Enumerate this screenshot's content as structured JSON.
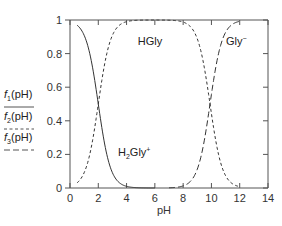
{
  "chart_data": {
    "type": "line",
    "title": "",
    "xlabel": "pH",
    "ylabel": "",
    "xlim": [
      0,
      14
    ],
    "ylim": [
      0,
      1
    ],
    "xticks": [
      0,
      2,
      4,
      6,
      8,
      10,
      12,
      14
    ],
    "xtick_labels": [
      "0",
      "2",
      "4",
      "6",
      "8",
      "10",
      "12",
      "14"
    ],
    "yticks": [
      0,
      0.2,
      0.4,
      0.6,
      0.8,
      1
    ],
    "ytick_labels": [
      "0",
      "0.2",
      "0.4",
      "0.6",
      "0.8",
      "1"
    ],
    "grid": false,
    "legend_position": "left-outside",
    "pKa": [
      2.0,
      9.9
    ],
    "x_range_plotted": [
      0.5,
      12.0
    ],
    "series": [
      {
        "name": "f1(pH)",
        "species": "H2Gly+",
        "style": "solid",
        "x": [
          0.5,
          1,
          1.5,
          2,
          2.5,
          3,
          3.5,
          4,
          4.5,
          5,
          5.5,
          6
        ],
        "values": [
          0.99,
          0.91,
          0.76,
          0.5,
          0.24,
          0.09,
          0.03,
          0.01,
          0.003,
          0.001,
          0.0,
          0.0
        ]
      },
      {
        "name": "f2(pH)",
        "species": "HGly",
        "style": "short-dash",
        "x": [
          0.5,
          1,
          1.5,
          2,
          2.5,
          3,
          4,
          5,
          6,
          7,
          8,
          9,
          9.5,
          10,
          10.5,
          11,
          11.5,
          12
        ],
        "values": [
          0.03,
          0.09,
          0.24,
          0.5,
          0.76,
          0.91,
          0.99,
          1.0,
          1.0,
          1.0,
          0.99,
          0.89,
          0.72,
          0.44,
          0.2,
          0.07,
          0.02,
          0.01
        ]
      },
      {
        "name": "f3(pH)",
        "species": "Gly-",
        "style": "long-dash",
        "x": [
          7,
          8,
          8.5,
          9,
          9.5,
          10,
          10.5,
          11,
          11.5,
          12
        ],
        "values": [
          0.0,
          0.01,
          0.04,
          0.11,
          0.28,
          0.56,
          0.8,
          0.93,
          0.98,
          0.99
        ]
      }
    ],
    "annotations": [
      {
        "text": "HGly",
        "x": 4.6,
        "y": 0.88
      },
      {
        "text": "Gly⁻",
        "x": 10.6,
        "y": 0.88
      },
      {
        "text": "H₂Gly⁺",
        "x": 4.5,
        "y": 0.26
      }
    ]
  },
  "legend": {
    "items": [
      {
        "label_f": "f",
        "label_sub": "1",
        "label_rest": "(pH)",
        "style": "solid"
      },
      {
        "label_f": "f",
        "label_sub": "2",
        "label_rest": "(pH)",
        "style": "short-dash"
      },
      {
        "label_f": "f",
        "label_sub": "3",
        "label_rest": "(pH)",
        "style": "long-dash"
      }
    ]
  },
  "labels": {
    "xlabel": "pH",
    "hgly": "HGly",
    "gly_base": "Gly",
    "gly_sup": "−",
    "h2gly_h": "H",
    "h2gly_sub": "2",
    "h2gly_rest": "Gly",
    "h2gly_sup": "+"
  }
}
